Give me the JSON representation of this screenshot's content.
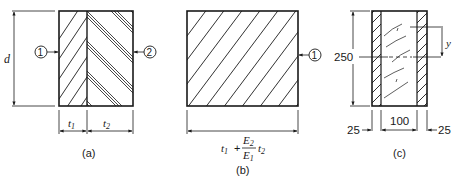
{
  "figure": {
    "panels": [
      {
        "id": "a",
        "caption": "(a)",
        "dimension_height": "d",
        "width_labels": [
          "t",
          "1",
          "t",
          "2"
        ],
        "material_markers": [
          "1",
          "2"
        ]
      },
      {
        "id": "b",
        "caption": "(b)",
        "width_formula": {
          "t1": "t",
          "t1_sub": "1",
          "plus": "+",
          "numerator": "E",
          "numerator_sub": "2",
          "denominator": "E",
          "denominator_sub": "1",
          "t2": "t",
          "t2_sub": "2"
        },
        "material_markers": [
          "1"
        ]
      },
      {
        "id": "c",
        "caption": "(c)",
        "height": "250",
        "left_flange": "25",
        "web": "100",
        "right_flange": "25",
        "dimension_y": "y"
      }
    ]
  },
  "colors": {
    "ink": "#1a1a1a",
    "background": "#ffffff"
  }
}
